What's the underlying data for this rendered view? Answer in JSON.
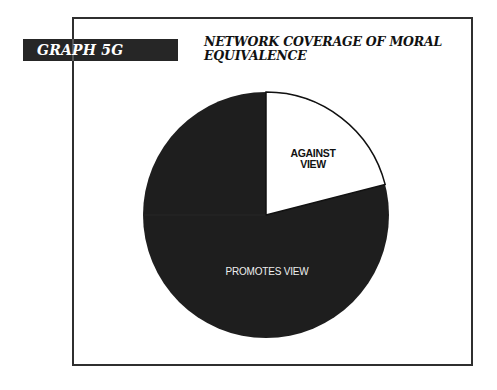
{
  "badge": {
    "label": "GRAPH 5G"
  },
  "title": {
    "line1": "NETWORK COVERAGE OF MORAL",
    "line2": "EQUIVALENCE"
  },
  "slices": {
    "against": {
      "label_line1": "AGAINST",
      "label_line2": "VIEW",
      "color": "#ffffff"
    },
    "promotes": {
      "label": "PROMOTES VIEW",
      "color": "#1e1e1e"
    }
  },
  "chart_data": {
    "type": "pie",
    "title": "NETWORK COVERAGE OF MORAL EQUIVALENCE",
    "subtitle": "GRAPH 5G",
    "categories": [
      "AGAINST VIEW",
      "PROMOTES VIEW"
    ],
    "values": [
      21,
      79
    ],
    "units": "percent (estimated from slice angles, no data labels shown)",
    "colors": [
      "#ffffff",
      "#1e1e1e"
    ],
    "start_angle": "12 o'clock, clockwise",
    "legend": "none (labels inside slices)"
  }
}
